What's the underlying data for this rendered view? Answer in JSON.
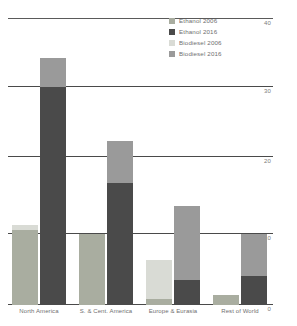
{
  "chart_data": {
    "type": "bar",
    "subtype": "grouped-stacked",
    "title": "",
    "xlabel": "",
    "ylabel": "",
    "ylim": [
      0,
      40
    ],
    "yticks": [
      0,
      10,
      20,
      30,
      40
    ],
    "ytick_labels": [
      "0",
      "10",
      "20",
      "30",
      "40"
    ],
    "y_axis_position": "right",
    "grid": true,
    "gridlines_at": [
      10,
      20,
      30,
      40
    ],
    "legend_position": "top-right",
    "categories": [
      "North America",
      "S. & Cent. America",
      "Europe & Eurasia",
      "Rest of World"
    ],
    "legend": [
      "Ethanol 2006",
      "Ethanol 2016",
      "Biodiesel 2006",
      "Biodiesel 2016"
    ],
    "series": [
      {
        "name": "Ethanol 2006",
        "year": "2006",
        "fuel": "Ethanol",
        "color": "#a9ada0",
        "stack": "2006",
        "values": [
          10.5,
          10.0,
          0.8,
          1.4
        ]
      },
      {
        "name": "Biodiesel 2006",
        "year": "2006",
        "fuel": "Biodiesel",
        "color": "#d9dbd5",
        "stack": "2006",
        "values": [
          0.7,
          0.0,
          5.5,
          0.0
        ]
      },
      {
        "name": "Ethanol 2016",
        "year": "2016",
        "fuel": "Ethanol",
        "color": "#4a4a4a",
        "stack": "2016",
        "values": [
          30.5,
          17.0,
          3.5,
          4.0
        ]
      },
      {
        "name": "Biodiesel 2016",
        "year": "2016",
        "fuel": "Biodiesel",
        "color": "#9a9a9a",
        "stack": "2016",
        "values": [
          4.0,
          6.0,
          10.3,
          6.0
        ]
      }
    ]
  },
  "colors": {
    "ethanol_2006": "#a9ada0",
    "ethanol_2016": "#4a4a4a",
    "biodiesel_2006": "#d9dbd5",
    "biodiesel_2016": "#9a9a9a",
    "gridline": "#4a4a4a",
    "tick_text": "#7b7b7b",
    "label_text": "#6f6f6f",
    "background": "#ffffff"
  }
}
